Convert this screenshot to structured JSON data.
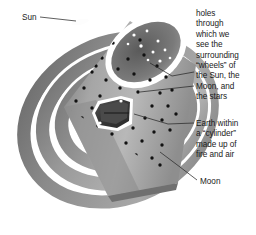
{
  "figure": {
    "background_color": "#ffffff",
    "ring_color": "#8d8d8d",
    "ring_dark_color": "#6f6f6f",
    "ring_light_color": "#c8c8c8",
    "cylinder_color": "#9a9a9a",
    "cylinder_shadow_color": "#6a6a6a",
    "rim_color": "#ffffff",
    "hole_color": "#111111",
    "star_color": "#ffffff",
    "earth_color": "#3a3a3a",
    "leader_line_color": "#2a2a2a",
    "text_color": "#1a1a1a"
  },
  "labels": {
    "sun": "Sun",
    "moon": "Moon"
  },
  "captions": {
    "holes": "holes\nthrough\nwhich we\nsee the\nsurrounding\n“wheels” of\nthe Sun, the\nMoon, and\nthe stars",
    "earth": "Earth within\na “cylinder”\nmade up of\nfire and air"
  }
}
